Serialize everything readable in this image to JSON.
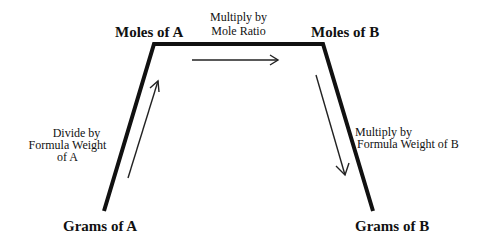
{
  "diagram": {
    "nodes": {
      "moles_a": "Moles of A",
      "moles_b": "Moles of B",
      "grams_a": "Grams of A",
      "grams_b": "Grams of B"
    },
    "steps": {
      "grams_to_moles_a": {
        "line1": "Divide by",
        "line2": "Formula Weight",
        "line3": "of A"
      },
      "moles_a_to_moles_b": {
        "line1": "Multiply by",
        "line2": "Mole Ratio"
      },
      "moles_b_to_grams_b": {
        "line1": "Multiply by",
        "line2": "Formula Weight of B"
      }
    },
    "edges": [
      {
        "from": "Grams of A",
        "to": "Moles of A",
        "direction": "up"
      },
      {
        "from": "Moles of A",
        "to": "Moles of B",
        "direction": "right"
      },
      {
        "from": "Moles of B",
        "to": "Grams of B",
        "direction": "down"
      }
    ],
    "colors": {
      "stroke": "#111111",
      "background": "#ffffff"
    }
  }
}
